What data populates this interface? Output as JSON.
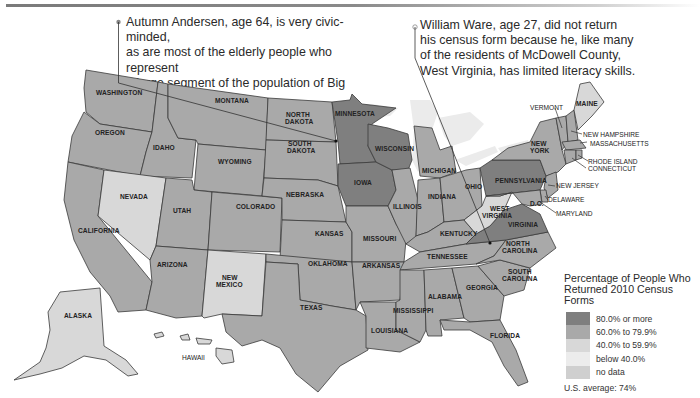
{
  "callouts": [
    {
      "id": "big-stone",
      "lines": [
        "Autumn Andersen, age 64, is very civic-minded,",
        "as are most of the elderly people who represent",
        "a large segment of the population of Big Stone",
        "County, Minnesota."
      ]
    },
    {
      "id": "mcdowell",
      "lines": [
        "William Ware, age 27, did not return",
        "his census form because he, like many",
        "of the residents of McDowell County,",
        "West Virginia, has limited literacy skills."
      ]
    }
  ],
  "legend": {
    "title_line1": "Percentage of People Who",
    "title_line2": "Returned 2010 Census Forms",
    "items": [
      {
        "label": "80.0% or more",
        "color": "#7f7f7f"
      },
      {
        "label": "60.0% to 79.9%",
        "color": "#a9a9a9"
      },
      {
        "label": "40.0% to 59.9%",
        "color": "#d8d8d8"
      },
      {
        "label": "below 40.0%",
        "color": "#ececec"
      },
      {
        "label": "no data",
        "color": "#cfcfcf"
      }
    ],
    "average": "U.S. average: 74%"
  },
  "states": [
    {
      "name": "WASHINGTON",
      "class": "60.0% to 79.9%"
    },
    {
      "name": "OREGON",
      "class": "60.0% to 79.9%"
    },
    {
      "name": "CALIFORNIA",
      "class": "60.0% to 79.9%"
    },
    {
      "name": "IDAHO",
      "class": "60.0% to 79.9%"
    },
    {
      "name": "NEVADA",
      "class": "40.0% to 59.9%"
    },
    {
      "name": "MONTANA",
      "class": "60.0% to 79.9%"
    },
    {
      "name": "WYOMING",
      "class": "60.0% to 79.9%"
    },
    {
      "name": "UTAH",
      "class": "60.0% to 79.9%"
    },
    {
      "name": "ARIZONA",
      "class": "60.0% to 79.9%"
    },
    {
      "name": "COLORADO",
      "class": "60.0% to 79.9%"
    },
    {
      "name": "NEW MEXICO",
      "class": "40.0% to 59.9%"
    },
    {
      "name": "NORTH DAKOTA",
      "class": "60.0% to 79.9%"
    },
    {
      "name": "SOUTH DAKOTA",
      "class": "60.0% to 79.9%"
    },
    {
      "name": "NEBRASKA",
      "class": "60.0% to 79.9%"
    },
    {
      "name": "KANSAS",
      "class": "60.0% to 79.9%"
    },
    {
      "name": "OKLAHOMA",
      "class": "60.0% to 79.9%"
    },
    {
      "name": "TEXAS",
      "class": "60.0% to 79.9%"
    },
    {
      "name": "MINNESOTA",
      "class": "80.0% or more"
    },
    {
      "name": "IOWA",
      "class": "80.0% or more"
    },
    {
      "name": "MISSOURI",
      "class": "60.0% to 79.9%"
    },
    {
      "name": "ARKANSAS",
      "class": "60.0% to 79.9%"
    },
    {
      "name": "LOUISIANA",
      "class": "60.0% to 79.9%"
    },
    {
      "name": "WISCONSIN",
      "class": "80.0% or more"
    },
    {
      "name": "ILLINOIS",
      "class": "60.0% to 79.9%"
    },
    {
      "name": "MICHIGAN",
      "class": "60.0% to 79.9%"
    },
    {
      "name": "INDIANA",
      "class": "60.0% to 79.9%"
    },
    {
      "name": "OHIO",
      "class": "60.0% to 79.9%"
    },
    {
      "name": "KENTUCKY",
      "class": "60.0% to 79.9%"
    },
    {
      "name": "TENNESSEE",
      "class": "60.0% to 79.9%"
    },
    {
      "name": "MISSISSIPPI",
      "class": "60.0% to 79.9%"
    },
    {
      "name": "ALABAMA",
      "class": "60.0% to 79.9%"
    },
    {
      "name": "GEORGIA",
      "class": "60.0% to 79.9%"
    },
    {
      "name": "FLORIDA",
      "class": "60.0% to 79.9%"
    },
    {
      "name": "SOUTH CAROLINA",
      "class": "60.0% to 79.9%"
    },
    {
      "name": "NORTH CAROLINA",
      "class": "60.0% to 79.9%"
    },
    {
      "name": "VIRGINIA",
      "class": "80.0% or more"
    },
    {
      "name": "WEST VIRGINIA",
      "class": "40.0% to 59.9%"
    },
    {
      "name": "PENNSYLVANIA",
      "class": "80.0% or more"
    },
    {
      "name": "NEW YORK",
      "class": "60.0% to 79.9%"
    },
    {
      "name": "VERMONT",
      "class": "60.0% to 79.9%"
    },
    {
      "name": "NEW HAMPSHIRE",
      "class": "60.0% to 79.9%"
    },
    {
      "name": "MAINE",
      "class": "40.0% to 59.9%"
    },
    {
      "name": "MASSACHUSETTS",
      "class": "60.0% to 79.9%"
    },
    {
      "name": "RHODE ISLAND",
      "class": "60.0% to 79.9%"
    },
    {
      "name": "CONNECTICUT",
      "class": "60.0% to 79.9%"
    },
    {
      "name": "NEW JERSEY",
      "class": "60.0% to 79.9%"
    },
    {
      "name": "DELAWARE",
      "class": "60.0% to 79.9%"
    },
    {
      "name": "MARYLAND",
      "class": "60.0% to 79.9%"
    },
    {
      "name": "ALASKA",
      "class": "40.0% to 59.9%"
    },
    {
      "name": "HAWAII",
      "class": "40.0% to 59.9%"
    }
  ],
  "labels": {
    "dc": "D.C."
  }
}
